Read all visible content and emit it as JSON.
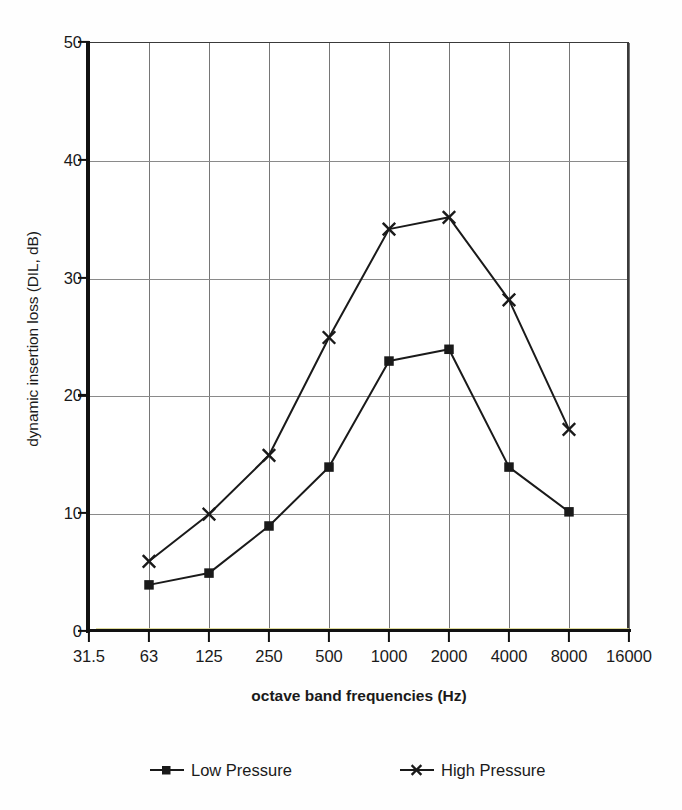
{
  "chart_data": {
    "type": "line",
    "title": "",
    "xlabel": "octave band frequencies (Hz)",
    "ylabel": "dynamic insertion loss (DIL, dB)",
    "categories": [
      "31.5",
      "63",
      "125",
      "250",
      "500",
      "1000",
      "2000",
      "4000",
      "8000",
      "16000"
    ],
    "x_tick_labels": [
      "31.5",
      "63",
      "125",
      "250",
      "500",
      "1000",
      "2000",
      "4000",
      "8000",
      "16000"
    ],
    "y_tick_labels": [
      "0",
      "10",
      "20",
      "30",
      "40",
      "50"
    ],
    "y_ticks": [
      0,
      10,
      20,
      30,
      40,
      50
    ],
    "ylim": [
      0,
      50
    ],
    "grid": true,
    "legend_position": "bottom",
    "series": [
      {
        "name": "Low Pressure",
        "marker": "square",
        "color": "#1a1a1a",
        "x": [
          "63",
          "125",
          "250",
          "500",
          "1000",
          "2000",
          "4000",
          "8000"
        ],
        "values": [
          4,
          5,
          9,
          14,
          23,
          24,
          14,
          10.2
        ]
      },
      {
        "name": "High Pressure",
        "marker": "x",
        "color": "#1a1a1a",
        "x": [
          "63",
          "125",
          "250",
          "500",
          "1000",
          "2000",
          "4000",
          "8000"
        ],
        "values": [
          6,
          10,
          15,
          25,
          34.2,
          35.2,
          28.2,
          17.2
        ]
      }
    ]
  },
  "legend": {
    "items": [
      {
        "label": "Low Pressure",
        "marker": "square"
      },
      {
        "label": "High Pressure",
        "marker": "x"
      }
    ]
  },
  "axes": {
    "x_title": "octave band frequencies (Hz)",
    "y_title": "dynamic insertion loss (DIL, dB)"
  },
  "colors": {
    "line": "#1a1a1a",
    "grid": "#808080",
    "axis": "#111111",
    "background": "#ffffff",
    "axis_tint": "#d8d48a"
  }
}
